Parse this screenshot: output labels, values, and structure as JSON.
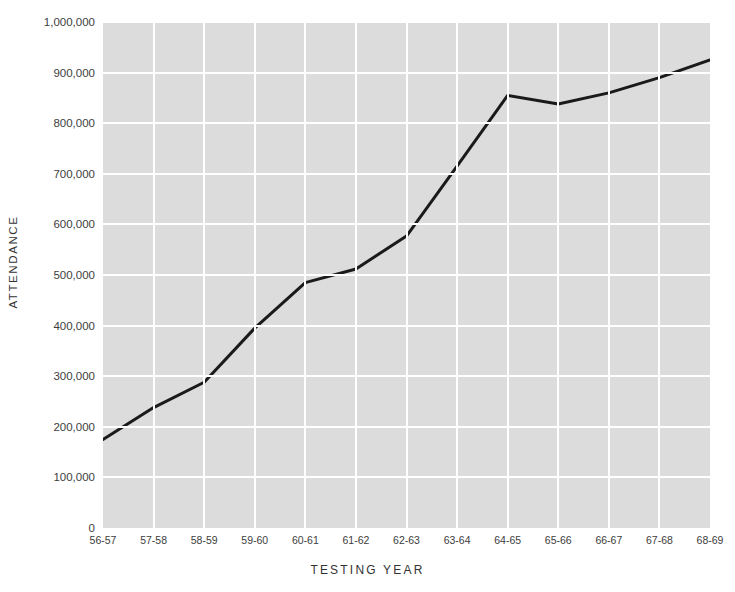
{
  "figure": {
    "title_clipped": "",
    "background": "#ffffff",
    "plot_background": "#dcdcdc",
    "gridline_color": "#ffffff",
    "line_color": "#1a1a1a"
  },
  "axes": {
    "y_title": "ATTENDANCE",
    "x_title": "TESTING YEAR"
  },
  "chart_data": {
    "type": "line",
    "title": "",
    "xlabel": "TESTING YEAR",
    "ylabel": "ATTENDANCE",
    "categories": [
      "56-57",
      "57-58",
      "58-59",
      "59-60",
      "60-61",
      "61-62",
      "62-63",
      "63-64",
      "64-65",
      "65-66",
      "66-67",
      "67-68",
      "68-69"
    ],
    "values": [
      175000,
      238000,
      288000,
      395000,
      485000,
      512000,
      577000,
      715000,
      855000,
      838000,
      860000,
      890000,
      925000
    ],
    "series": [
      {
        "name": "Attendance",
        "values": [
          175000,
          238000,
          288000,
          395000,
          485000,
          512000,
          577000,
          715000,
          855000,
          838000,
          860000,
          890000,
          925000
        ]
      }
    ],
    "ylim": [
      0,
      1000000
    ],
    "yticks": [
      0,
      100000,
      200000,
      300000,
      400000,
      500000,
      600000,
      700000,
      800000,
      900000,
      1000000
    ],
    "ytick_labels": [
      "0",
      "100,000",
      "200,000",
      "300,000",
      "400,000",
      "500,000",
      "600,000",
      "700,000",
      "800,000",
      "900,000",
      "1,000,000"
    ],
    "grid": true,
    "grid_axes": "both",
    "legend": false,
    "legend_position": "none",
    "line_color": "#1a1a1a",
    "line_width": 3,
    "markers": false
  }
}
